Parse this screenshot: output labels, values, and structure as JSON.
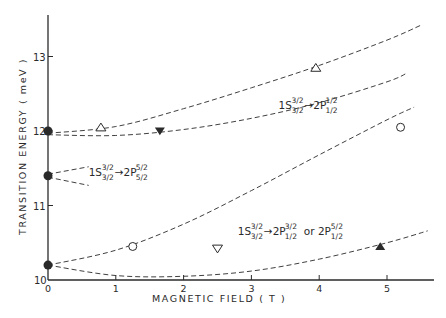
{
  "chart_data": {
    "type": "scatter",
    "title": "",
    "xlabel": "MAGNETIC FIELD ( T )",
    "ylabel": "TRANSITION ENERGY ( meV )",
    "xlim": [
      0,
      5.6
    ],
    "ylim": [
      10,
      13.6
    ],
    "x_ticks": [
      "0",
      "1",
      "2",
      "3",
      "4",
      "5"
    ],
    "y_ticks": [
      "10",
      "11",
      "12",
      "13"
    ],
    "grid": false,
    "annotations": [
      {
        "text": "1S3/2(3/2) → 2P1/2(1/2)",
        "base": "1S",
        "sup1": "3/2",
        "sub1": "3/2",
        "arrow": "→2P",
        "sup2": "1/2",
        "sub2": "1/2",
        "x": 3.4,
        "y": 12.3
      },
      {
        "text": "1S3/2(3/2) → 2P5/2(5/2)",
        "base": "1S",
        "sup1": "3/2",
        "sub1": "3/2",
        "arrow": "→2P",
        "sup2": "5/2",
        "sub2": "5/2",
        "x": 0.6,
        "y": 11.4
      },
      {
        "text": "1S3/2(3/2) → 2P1/2(3/2) or 2P1/2(5/2)",
        "base": "1S",
        "sup1": "3/2",
        "sub1": "3/2",
        "arrow": "→2P",
        "sup2": "3/2",
        "sub2": "1/2",
        "or": "or 2P",
        "sup3": "5/2",
        "sub3": "1/2",
        "x": 2.8,
        "y": 10.6
      }
    ],
    "curves": [
      {
        "name": "upper-branch-a",
        "style": "dashed",
        "x": [
          0,
          1,
          2,
          3,
          4,
          5,
          5.5
        ],
        "y": [
          11.97,
          12.06,
          12.3,
          12.58,
          12.88,
          13.22,
          13.42
        ]
      },
      {
        "name": "upper-branch-b",
        "style": "dashed",
        "x": [
          0,
          1,
          2,
          3,
          4,
          5,
          5.3
        ],
        "y": [
          11.95,
          11.94,
          12.02,
          12.17,
          12.38,
          12.66,
          12.78
        ]
      },
      {
        "name": "middle-branch-a",
        "style": "dashed",
        "x": [
          0,
          0.6
        ],
        "y": [
          11.42,
          11.52
        ]
      },
      {
        "name": "middle-branch-b",
        "style": "dashed",
        "x": [
          0,
          0.6
        ],
        "y": [
          11.38,
          11.27
        ]
      },
      {
        "name": "lower-branch-a",
        "style": "dashed",
        "x": [
          0,
          1,
          2,
          3,
          4,
          5,
          5.4
        ],
        "y": [
          10.2,
          10.4,
          10.75,
          11.2,
          11.68,
          12.15,
          12.32
        ]
      },
      {
        "name": "lower-branch-b",
        "style": "dashed",
        "x": [
          0,
          1,
          2,
          3,
          4,
          5,
          5.6
        ],
        "y": [
          10.2,
          10.06,
          10.05,
          10.12,
          10.28,
          10.5,
          10.66
        ]
      }
    ],
    "series": [
      {
        "name": "zero-field",
        "marker": "filled-circle",
        "x": [
          0,
          0,
          0
        ],
        "y": [
          12.0,
          11.4,
          10.2
        ]
      },
      {
        "name": "open-triangle-up",
        "marker": "open-triangle-up",
        "x": [
          0.78,
          3.95
        ],
        "y": [
          12.05,
          12.85
        ]
      },
      {
        "name": "filled-triangle-down",
        "marker": "filled-triangle-down",
        "x": [
          1.65
        ],
        "y": [
          12.0
        ]
      },
      {
        "name": "open-circle",
        "marker": "open-circle",
        "x": [
          1.25,
          5.2
        ],
        "y": [
          10.45,
          12.05
        ]
      },
      {
        "name": "open-triangle-down",
        "marker": "open-triangle-down",
        "x": [
          2.5
        ],
        "y": [
          10.42
        ]
      },
      {
        "name": "filled-triangle-up",
        "marker": "filled-triangle-up",
        "x": [
          4.9
        ],
        "y": [
          10.45
        ]
      }
    ]
  },
  "colors": {
    "ink": "#2a2a2a",
    "background": "#ffffff"
  }
}
